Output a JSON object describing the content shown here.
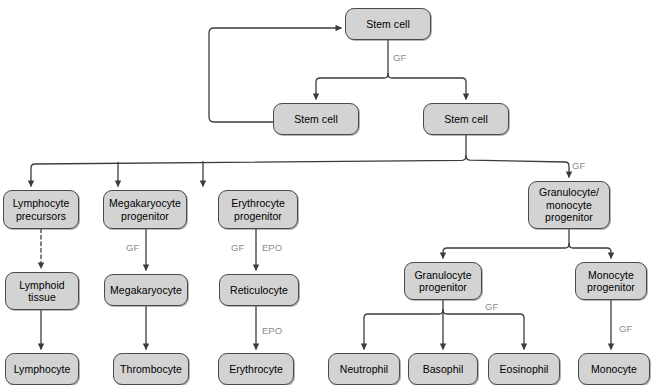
{
  "diagram": {
    "style": {
      "node_fill": "#d3d3d3",
      "node_border": "#4a4a4a",
      "edge_color": "#3c3c3c",
      "label_color": "#8c8c8c",
      "background": "#ffffff"
    },
    "nodes": [
      {
        "id": "stem_top",
        "label": "Stem cell",
        "x": 345,
        "y": 8,
        "w": 86,
        "h": 32
      },
      {
        "id": "stem_left",
        "label": "Stem cell",
        "x": 273,
        "y": 103,
        "w": 86,
        "h": 32
      },
      {
        "id": "stem_right",
        "label": "Stem cell",
        "x": 423,
        "y": 103,
        "w": 86,
        "h": 32
      },
      {
        "id": "lymph_prec",
        "label": "Lymphocyte\nprecursors",
        "x": 3,
        "y": 190,
        "w": 76,
        "h": 39
      },
      {
        "id": "mega_prog",
        "label": "Megakaryocyte\nprogenitor",
        "x": 103,
        "y": 190,
        "w": 84,
        "h": 39
      },
      {
        "id": "eryth_prog",
        "label": "Erythrocyte\nprogenitor",
        "x": 218,
        "y": 190,
        "w": 80,
        "h": 39
      },
      {
        "id": "gran_mono_prog",
        "label": "Granulocyte/\nmonocyte\nprogenitor",
        "x": 528,
        "y": 181,
        "w": 82,
        "h": 48
      },
      {
        "id": "lymphoid_tissue",
        "label": "Lymphoid\ntissue",
        "x": 5,
        "y": 272,
        "w": 74,
        "h": 38
      },
      {
        "id": "megakaryocyte",
        "label": "Megakaryocyte",
        "x": 104,
        "y": 274,
        "w": 84,
        "h": 32
      },
      {
        "id": "reticulocyte",
        "label": "Reticulocyte",
        "x": 219,
        "y": 274,
        "w": 80,
        "h": 32
      },
      {
        "id": "gran_prog",
        "label": "Granulocyte\nprogenitor",
        "x": 404,
        "y": 262,
        "w": 78,
        "h": 38
      },
      {
        "id": "mono_prog",
        "label": "Monocyte\nprogenitor",
        "x": 575,
        "y": 262,
        "w": 72,
        "h": 38
      },
      {
        "id": "lymphocyte",
        "label": "Lymphocyte",
        "x": 5,
        "y": 353,
        "w": 74,
        "h": 32
      },
      {
        "id": "thrombocyte",
        "label": "Thrombocyte",
        "x": 113,
        "y": 353,
        "w": 76,
        "h": 32
      },
      {
        "id": "erythrocyte",
        "label": "Erythrocyte",
        "x": 218,
        "y": 353,
        "w": 76,
        "h": 32
      },
      {
        "id": "neutrophil",
        "label": "Neutrophil",
        "x": 328,
        "y": 353,
        "w": 72,
        "h": 32
      },
      {
        "id": "basophil",
        "label": "Basophil",
        "x": 408,
        "y": 353,
        "w": 70,
        "h": 32
      },
      {
        "id": "eosinophil",
        "label": "Eosinophil",
        "x": 488,
        "y": 353,
        "w": 72,
        "h": 32
      },
      {
        "id": "monocyte",
        "label": "Monocyte",
        "x": 578,
        "y": 353,
        "w": 72,
        "h": 32
      }
    ],
    "edge_labels": [
      {
        "id": "gf_top",
        "text": "GF",
        "x": 393,
        "y": 52
      },
      {
        "id": "gf_gmp",
        "text": "GF",
        "x": 572,
        "y": 160
      },
      {
        "id": "gf_mega",
        "text": "GF",
        "x": 126,
        "y": 242
      },
      {
        "id": "gf_eryth",
        "text": "GF",
        "x": 231,
        "y": 242
      },
      {
        "id": "epo_eryth",
        "text": "EPO",
        "x": 262,
        "y": 242
      },
      {
        "id": "epo_retic",
        "text": "EPO",
        "x": 262,
        "y": 325
      },
      {
        "id": "gf_granprog",
        "text": "GF",
        "x": 485,
        "y": 301
      },
      {
        "id": "gf_monoprog",
        "text": "GF",
        "x": 619,
        "y": 323
      }
    ],
    "edges": [
      {
        "id": "stem-top-to-split",
        "from": "stem_top",
        "to": "split-row2",
        "style": "solid"
      },
      {
        "id": "split-to-stem-left",
        "from": "split-row2",
        "to": "stem_left",
        "style": "solid"
      },
      {
        "id": "split-to-stem-right",
        "from": "split-row2",
        "to": "stem_right",
        "style": "solid"
      },
      {
        "id": "feedback-loop",
        "from": "stem_left",
        "to": "stem_top",
        "style": "solid"
      },
      {
        "id": "stem-right-to-bus",
        "from": "stem_right",
        "to": "lineage-bus",
        "style": "solid"
      },
      {
        "id": "bus-to-lymph-prec",
        "from": "lineage-bus",
        "to": "lymph_prec",
        "style": "solid"
      },
      {
        "id": "bus-to-mega-prog",
        "from": "lineage-bus",
        "to": "mega_prog",
        "style": "solid"
      },
      {
        "id": "bus-to-eryth-prog",
        "from": "lineage-bus",
        "to": "eryth_prog",
        "style": "solid"
      },
      {
        "id": "bus-to-gmp",
        "from": "lineage-bus",
        "to": "gran_mono_prog",
        "style": "solid"
      },
      {
        "id": "lymph-prec-to-tissue",
        "from": "lymph_prec",
        "to": "lymphoid_tissue",
        "style": "dashed"
      },
      {
        "id": "tissue-to-lymphocyte",
        "from": "lymphoid_tissue",
        "to": "lymphocyte",
        "style": "solid"
      },
      {
        "id": "mega-prog-to-mega",
        "from": "mega_prog",
        "to": "megakaryocyte",
        "style": "solid"
      },
      {
        "id": "mega-to-thrombocyte",
        "from": "megakaryocyte",
        "to": "thrombocyte",
        "style": "solid"
      },
      {
        "id": "eryth-prog-to-retic",
        "from": "eryth_prog",
        "to": "reticulocyte",
        "style": "solid"
      },
      {
        "id": "retic-to-erythrocyte",
        "from": "reticulocyte",
        "to": "erythrocyte",
        "style": "solid"
      },
      {
        "id": "gmp-to-gran-prog",
        "from": "gran_mono_prog",
        "to": "gran_prog",
        "style": "solid"
      },
      {
        "id": "gmp-to-mono-prog",
        "from": "gran_mono_prog",
        "to": "mono_prog",
        "style": "solid"
      },
      {
        "id": "gran-prog-to-neutrophil",
        "from": "gran_prog",
        "to": "neutrophil",
        "style": "solid"
      },
      {
        "id": "gran-prog-to-basophil",
        "from": "gran_prog",
        "to": "basophil",
        "style": "solid"
      },
      {
        "id": "gran-prog-to-eosinophil",
        "from": "gran_prog",
        "to": "eosinophil",
        "style": "solid"
      },
      {
        "id": "mono-prog-to-monocyte",
        "from": "mono_prog",
        "to": "monocyte",
        "style": "solid"
      }
    ]
  }
}
